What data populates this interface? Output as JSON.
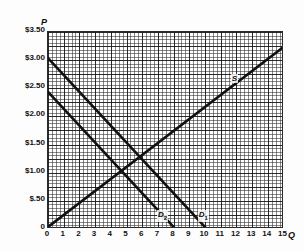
{
  "chart_data": {
    "type": "line",
    "title": "",
    "xlabel": "Q",
    "ylabel": "P",
    "xlim": [
      0,
      15.5
    ],
    "ylim": [
      0,
      3.75
    ],
    "grid": true,
    "legend": "inline-curve-labels",
    "x_ticks": [
      "0",
      "1",
      "2",
      "3",
      "4",
      "5",
      "6",
      "7",
      "8",
      "9",
      "10",
      "11",
      "12",
      "13",
      "14",
      "15"
    ],
    "x_tick_values": [
      0,
      1,
      2,
      3,
      4,
      5,
      6,
      7,
      8,
      9,
      10,
      11,
      12,
      13,
      14,
      15
    ],
    "y_ticks": [
      "$3.50",
      "$3.00",
      "$2.50",
      "$2.00",
      "$1.50",
      "$1.00",
      "$.50",
      "0"
    ],
    "y_tick_values": [
      3.5,
      3.0,
      2.5,
      2.0,
      1.5,
      1.0,
      0.5,
      0
    ],
    "series": [
      {
        "name": "S",
        "label": "S",
        "role": "supply",
        "points": [
          [
            0,
            0
          ],
          [
            15,
            3.2
          ]
        ],
        "label_position": [
          11.7,
          2.62
        ]
      },
      {
        "name": "D1",
        "label": "D",
        "sublabel": "1",
        "role": "demand-original",
        "points": [
          [
            0,
            3.0
          ],
          [
            10,
            0
          ]
        ],
        "label_position": [
          9.6,
          0.2
        ]
      },
      {
        "name": "D2",
        "label": "D",
        "sublabel": "2",
        "role": "demand-shifted",
        "points": [
          [
            0,
            2.4
          ],
          [
            8,
            0
          ]
        ],
        "label_position": [
          7.0,
          0.2
        ]
      }
    ],
    "equilibria": [
      {
        "series": "S x D1",
        "quantity": 5.8,
        "price": 1.23
      },
      {
        "series": "S x D2",
        "quantity": 4.6,
        "price": 0.98
      }
    ],
    "colors": {
      "curve": "#111111",
      "grid": "#333333",
      "axis": "#1a1a1a",
      "background": "#ffffff",
      "text": "#111111"
    }
  }
}
